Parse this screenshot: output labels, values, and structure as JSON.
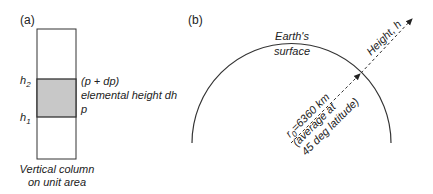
{
  "panel_a": {
    "label": "(a)",
    "h2_label": "h",
    "h2_sub": "2",
    "h1_label": "h",
    "h1_sub": "1",
    "top_pressure": "(p + dp)",
    "element_label": "elemental height dh",
    "bottom_pressure": "p",
    "caption_line1": "Vertical column",
    "caption_line2": "on unit area",
    "colors": {
      "shaded": "#c8c8c8",
      "stroke": "#333333"
    }
  },
  "panel_b": {
    "label": "(b)",
    "surface_line1": "Earth's",
    "surface_line2": "surface",
    "height_label": "Height, h",
    "radius_symbol": "r",
    "radius_sub": "0",
    "radius_value": "=6360 km",
    "radius_note_line1": "(average at",
    "radius_note_line2": "45 deg latitude)"
  }
}
